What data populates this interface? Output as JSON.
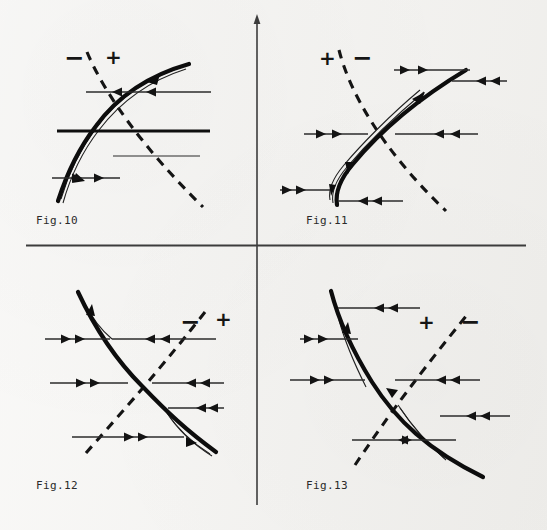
{
  "page": {
    "background_color": "#f3f2ef",
    "ink_color": "#111111",
    "width": 547,
    "height": 530
  },
  "dividers": {
    "vertical": {
      "x": 257,
      "y_top": 18,
      "y_bottom": 505,
      "has_arrow_tip": true
    },
    "horizontal": {
      "y": 245,
      "x_left": 26,
      "x_right": 526
    }
  },
  "figures": [
    {
      "id": "fig10",
      "label": "Fig.10",
      "label_x": 36,
      "label_y": 214,
      "signs": [
        {
          "symbol": "−",
          "x": 64,
          "y": 46,
          "region": "left-of-dashed"
        },
        {
          "symbol": "+",
          "x": 105,
          "y": 47,
          "region": "right-of-dashed"
        }
      ],
      "solid_curve": "increasing-sigmoid",
      "dashed_curve": "decreasing",
      "nullcline_style": "dashed",
      "flow_lines": [
        {
          "y": 92,
          "x_from": 86,
          "x_to": 211,
          "arrow_dir": "left",
          "arrow_count": 2,
          "weight": "thin"
        },
        {
          "y": 131,
          "x_from": 57,
          "x_to": 210,
          "arrow_dir": "none",
          "arrow_count": 0,
          "weight": "thick"
        },
        {
          "y": 178,
          "x_from": 52,
          "x_to": 120,
          "arrow_dir": "right",
          "arrow_count": 2,
          "weight": "thin"
        },
        {
          "y": 156,
          "x_from": 112,
          "x_to": 200,
          "arrow_dir": "none",
          "arrow_count": 0,
          "weight": "thin"
        }
      ]
    },
    {
      "id": "fig11",
      "label": "Fig.11",
      "label_x": 306,
      "label_y": 214,
      "signs": [
        {
          "symbol": "+",
          "x": 319,
          "y": 48,
          "region": "left-of-dashed"
        },
        {
          "symbol": "−",
          "x": 352,
          "y": 46,
          "region": "right-of-dashed"
        }
      ],
      "solid_curve": "increasing-sigmoid",
      "dashed_curve": "decreasing",
      "nullcline_style": "dashed",
      "flow_lines": [
        {
          "y": 70,
          "x_from": 394,
          "x_to": 470,
          "arrow_dir": "right",
          "arrow_count": 2,
          "weight": "thin"
        },
        {
          "y": 81,
          "x_from": 452,
          "x_to": 507,
          "arrow_dir": "left",
          "arrow_count": 2,
          "weight": "thin"
        },
        {
          "y": 134,
          "x_from": 304,
          "x_to": 368,
          "arrow_dir": "right",
          "arrow_count": 2,
          "weight": "thin"
        },
        {
          "y": 134,
          "x_from": 395,
          "x_to": 478,
          "arrow_dir": "left",
          "arrow_count": 2,
          "weight": "thin"
        },
        {
          "y": 190,
          "x_from": 280,
          "x_to": 330,
          "arrow_dir": "right",
          "arrow_count": 2,
          "weight": "thin"
        },
        {
          "y": 200,
          "x_from": 338,
          "x_to": 403,
          "arrow_dir": "left",
          "arrow_count": 2,
          "weight": "thin"
        }
      ]
    },
    {
      "id": "fig12",
      "label": "Fig.12",
      "label_x": 36,
      "label_y": 479,
      "signs": [
        {
          "symbol": "−",
          "x": 180,
          "y": 310,
          "region": "left-of-dashed"
        },
        {
          "symbol": "+",
          "x": 215,
          "y": 309,
          "region": "right-of-dashed"
        }
      ],
      "solid_curve": "decreasing",
      "dashed_curve": "increasing",
      "nullcline_style": "dashed",
      "flow_lines": [
        {
          "y": 339,
          "x_from": 45,
          "x_to": 110,
          "arrow_dir": "left",
          "arrow_count": 2,
          "weight": "thin"
        },
        {
          "y": 339,
          "x_from": 125,
          "x_to": 202,
          "arrow_dir": "right",
          "arrow_count": 2,
          "weight": "thin"
        },
        {
          "y": 383,
          "x_from": 47,
          "x_to": 128,
          "arrow_dir": "left",
          "arrow_count": 2,
          "weight": "thin"
        },
        {
          "y": 383,
          "x_from": 152,
          "x_to": 224,
          "arrow_dir": "right",
          "arrow_count": 2,
          "weight": "thin"
        },
        {
          "y": 408,
          "x_from": 168,
          "x_to": 224,
          "arrow_dir": "right",
          "arrow_count": 2,
          "weight": "thin"
        },
        {
          "y": 437,
          "x_from": 72,
          "x_to": 180,
          "arrow_dir": "left",
          "arrow_count": 2,
          "weight": "thin"
        }
      ]
    },
    {
      "id": "fig13",
      "label": "Fig.13",
      "label_x": 306,
      "label_y": 479,
      "signs": [
        {
          "symbol": "+",
          "x": 418,
          "y": 312,
          "region": "left-of-dashed"
        },
        {
          "symbol": "−",
          "x": 460,
          "y": 310,
          "region": "right-of-dashed"
        }
      ],
      "solid_curve": "decreasing",
      "dashed_curve": "increasing",
      "nullcline_style": "dashed",
      "flow_lines": [
        {
          "y": 308,
          "x_from": 338,
          "x_to": 420,
          "arrow_dir": "right",
          "arrow_count": 2,
          "weight": "thin"
        },
        {
          "y": 339,
          "x_from": 300,
          "x_to": 357,
          "arrow_dir": "left",
          "arrow_count": 2,
          "weight": "thin"
        },
        {
          "y": 380,
          "x_from": 290,
          "x_to": 365,
          "arrow_dir": "left",
          "arrow_count": 2,
          "weight": "thin"
        },
        {
          "y": 380,
          "x_from": 395,
          "x_to": 480,
          "arrow_dir": "right",
          "arrow_count": 2,
          "weight": "thin"
        },
        {
          "y": 416,
          "x_from": 440,
          "x_to": 510,
          "arrow_dir": "right",
          "arrow_count": 2,
          "weight": "thin"
        },
        {
          "y": 440,
          "x_from": 352,
          "x_to": 455,
          "arrow_dir": "right",
          "arrow_count": 2,
          "weight": "thin"
        }
      ]
    }
  ]
}
